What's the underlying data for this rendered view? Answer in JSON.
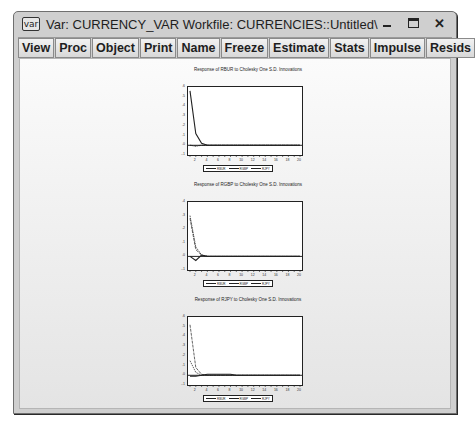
{
  "window": {
    "icon_label": "var",
    "title": "Var: CURRENCY_VAR   Workfile: CURRENCIES::Untitled\\",
    "controls": [
      "minimize",
      "maximize",
      "close"
    ]
  },
  "toolbar": {
    "group1": [
      "View",
      "Proc",
      "Object"
    ],
    "group2": [
      "Print",
      "Name",
      "Freeze"
    ],
    "group3": [
      "Estimate",
      "Stats",
      "Impulse",
      "Resids"
    ]
  },
  "chart_data": [
    {
      "type": "line",
      "title": "Response of RBUR to Cholesky One S.D. Innovations",
      "x": [
        1,
        2,
        3,
        4,
        5,
        6,
        7,
        8,
        9,
        10,
        11,
        12,
        13,
        14,
        15,
        16,
        17,
        18,
        19,
        20
      ],
      "x_ticks": [
        "2",
        "4",
        "6",
        "8",
        "10",
        "12",
        "14",
        "16",
        "18",
        "20"
      ],
      "y_ticks": [
        ".6",
        ".5",
        ".4",
        ".3",
        ".2",
        ".1",
        ".0",
        "-.1"
      ],
      "ylim": [
        -0.1,
        0.6
      ],
      "series": [
        {
          "name": "RBUR",
          "values": [
            0.56,
            0.12,
            0.02,
            0.0,
            0,
            0,
            0,
            0,
            0,
            0,
            0,
            0,
            0,
            0,
            0,
            0,
            0,
            0,
            0,
            0
          ]
        },
        {
          "name": "RGBP",
          "values": [
            0.0,
            -0.01,
            0.0,
            0,
            0,
            0,
            0,
            0,
            0,
            0,
            0,
            0,
            0,
            0,
            0,
            0,
            0,
            0,
            0,
            0
          ]
        },
        {
          "name": "RJPY",
          "values": [
            0.0,
            -0.005,
            0.0,
            0,
            0,
            0,
            0,
            0,
            0,
            0,
            0,
            0,
            0,
            0,
            0,
            0,
            0,
            0,
            0,
            0
          ]
        }
      ],
      "legend": [
        "RBUR",
        "RGBP",
        "RJPY"
      ]
    },
    {
      "type": "line",
      "title": "Response of RGBP to Cholesky One S.D. Innovations",
      "x": [
        1,
        2,
        3,
        4,
        5,
        6,
        7,
        8,
        9,
        10,
        11,
        12,
        13,
        14,
        15,
        16,
        17,
        18,
        19,
        20
      ],
      "x_ticks": [
        "2",
        "4",
        "6",
        "8",
        "10",
        "12",
        "14",
        "16",
        "18",
        "20"
      ],
      "y_ticks": [
        ".4",
        ".3",
        ".2",
        ".1",
        ".0",
        "-.1"
      ],
      "ylim": [
        -0.1,
        0.4
      ],
      "series": [
        {
          "name": "RBUR",
          "values": [
            0.0,
            -0.03,
            0.01,
            0,
            0,
            0,
            0,
            0,
            0,
            0,
            0,
            0,
            0,
            0,
            0,
            0,
            0,
            0,
            0,
            0
          ]
        },
        {
          "name": "RGBP",
          "values": [
            0.3,
            0.07,
            0.01,
            0,
            0,
            0,
            0,
            0,
            0,
            0,
            0,
            0,
            0,
            0,
            0,
            0,
            0,
            0,
            0,
            0
          ]
        },
        {
          "name": "RJPY",
          "values": [
            0.28,
            0.05,
            0.01,
            0,
            0,
            0,
            0,
            0,
            0,
            0,
            0,
            0,
            0,
            0,
            0,
            0,
            0,
            0,
            0,
            0
          ]
        }
      ],
      "legend": [
        "RBUR",
        "RGBP",
        "RJPY"
      ]
    },
    {
      "type": "line",
      "title": "Response of RJPY to Cholesky One S.D. Innovations",
      "x": [
        1,
        2,
        3,
        4,
        5,
        6,
        7,
        8,
        9,
        10,
        11,
        12,
        13,
        14,
        15,
        16,
        17,
        18,
        19,
        20
      ],
      "x_ticks": [
        "2",
        "4",
        "6",
        "8",
        "10",
        "12",
        "14",
        "16",
        "18",
        "20"
      ],
      "y_ticks": [
        ".6",
        ".5",
        ".4",
        ".3",
        ".2",
        ".1",
        ".0",
        "-.1"
      ],
      "ylim": [
        -0.1,
        0.6
      ],
      "series": [
        {
          "name": "RBUR",
          "values": [
            -0.01,
            -0.01,
            0.0,
            0.01,
            0.01,
            0.01,
            0.01,
            0.01,
            0,
            0,
            0,
            0,
            0,
            0,
            0,
            0,
            0,
            0,
            0,
            0
          ]
        },
        {
          "name": "RGBP",
          "values": [
            0.15,
            0.03,
            0.0,
            0,
            0,
            0,
            0,
            0,
            0,
            0,
            0,
            0,
            0,
            0,
            0,
            0,
            0,
            0,
            0,
            0
          ]
        },
        {
          "name": "RJPY",
          "values": [
            0.52,
            0.08,
            0.01,
            0,
            0,
            0,
            0,
            0,
            0,
            0,
            0,
            0,
            0,
            0,
            0,
            0,
            0,
            0,
            0,
            0
          ]
        }
      ],
      "legend": [
        "RBUR",
        "RGBP",
        "RJPY"
      ]
    }
  ]
}
